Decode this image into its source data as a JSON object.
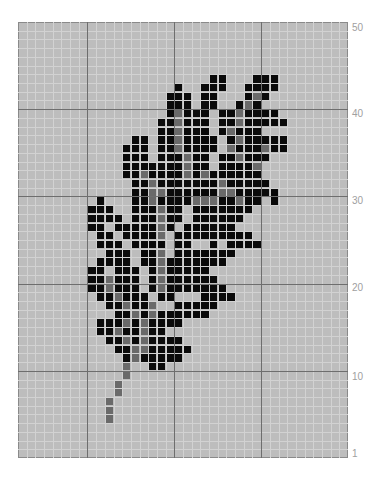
{
  "chart_data": {
    "type": "heatmap",
    "title": "",
    "grid": {
      "columns": 38,
      "rows": 50,
      "row_order": "row 50 at top, row 1 at bottom"
    },
    "major_grid_every": 10,
    "y_tick_labels": [
      "50",
      "40",
      "30",
      "20",
      "10",
      "1"
    ],
    "y_tick_rows": [
      50,
      40,
      30,
      20,
      10,
      1
    ],
    "colors": {
      "background": "#bdbdbd",
      "fill": "#0a0a0a",
      "vein": "#6a6a6a",
      "minor_grid": "#d2d2d2",
      "major_grid": "#6e6e6e",
      "label": "#a0a0a0"
    },
    "legend": {
      "#": "black cell",
      "g": "gray cell (vein/stem)"
    },
    "cells": {
      "44": {
        "#": [
          23,
          24,
          28,
          29,
          30
        ],
        "g": []
      },
      "43": {
        "#": [
          19,
          22,
          23,
          24,
          27,
          28,
          29,
          30
        ],
        "g": []
      },
      "42": {
        "#": [
          18,
          19,
          20,
          22,
          23,
          27,
          29
        ],
        "g": [
          28
        ]
      },
      "41": {
        "#": [
          18,
          19,
          20,
          22,
          23,
          26,
          28
        ],
        "g": [
          27
        ]
      },
      "40": {
        "#": [
          18,
          20,
          21,
          22,
          24,
          25,
          27,
          28,
          29,
          30
        ],
        "g": [
          19,
          26
        ]
      },
      "39": {
        "#": [
          17,
          18,
          20,
          21,
          22,
          24,
          25,
          27,
          28,
          29,
          30,
          31
        ],
        "g": [
          19,
          26
        ]
      },
      "38": {
        "#": [
          17,
          18,
          20,
          21,
          22,
          24,
          26,
          27,
          28
        ],
        "g": [
          19,
          25
        ]
      },
      "37": {
        "#": [
          14,
          15,
          17,
          18,
          20,
          21,
          22,
          23,
          25,
          27,
          28,
          29,
          30,
          31
        ],
        "g": [
          19,
          26
        ]
      },
      "36": {
        "#": [
          13,
          14,
          15,
          17,
          18,
          20,
          21,
          22,
          23,
          26,
          27,
          28,
          30,
          31
        ],
        "g": [
          19,
          25,
          29
        ]
      },
      "35": {
        "#": [
          13,
          14,
          15,
          17,
          18,
          19,
          21,
          22,
          24,
          25,
          27,
          28,
          29
        ],
        "g": [
          20,
          26
        ]
      },
      "34": {
        "#": [
          13,
          14,
          15,
          16,
          17,
          18,
          19,
          21,
          22,
          24,
          25,
          26,
          27
        ],
        "g": [
          20,
          28
        ]
      },
      "33": {
        "#": [
          13,
          14,
          16,
          17,
          18,
          19,
          21,
          23,
          24,
          25,
          26,
          27,
          28
        ],
        "g": [
          15,
          20,
          22
        ]
      },
      "32": {
        "#": [
          14,
          15,
          17,
          18,
          19,
          20,
          21,
          22,
          23,
          25,
          26,
          27,
          28,
          29
        ],
        "g": [
          16,
          24
        ]
      },
      "31": {
        "#": [
          14,
          15,
          18,
          19,
          20,
          21,
          22,
          23,
          26,
          27,
          28,
          29,
          30
        ],
        "g": [
          16,
          17,
          24,
          25
        ]
      },
      "30": {
        "#": [
          10,
          14,
          15,
          17,
          18,
          19,
          20,
          24,
          25,
          27,
          28,
          30
        ],
        "g": [
          16,
          21,
          22,
          23,
          26
        ]
      },
      "29": {
        "#": [
          9,
          10,
          11,
          14,
          15,
          16,
          18,
          19,
          21,
          22,
          23,
          24,
          25,
          26,
          27
        ],
        "g": [
          17
        ]
      },
      "28": {
        "#": [
          9,
          10,
          11,
          12,
          14,
          15,
          16,
          18,
          19,
          21,
          22,
          23,
          24,
          25,
          26
        ],
        "g": [
          17
        ]
      },
      "27": {
        "#": [
          9,
          10,
          12,
          13,
          14,
          15,
          16,
          18,
          20,
          21,
          22,
          23,
          24,
          25
        ],
        "g": [
          17
        ]
      },
      "26": {
        "#": [
          10,
          11,
          13,
          14,
          15,
          16,
          19,
          20,
          21,
          22,
          23,
          24,
          25,
          26,
          27
        ],
        "g": [
          17
        ]
      },
      "25": {
        "#": [
          10,
          11,
          12,
          14,
          15,
          16,
          17,
          19,
          20,
          23,
          25,
          26,
          27,
          28
        ],
        "g": []
      },
      "24": {
        "#": [
          11,
          12,
          13,
          15,
          16,
          19,
          20,
          21,
          22,
          23,
          24,
          25
        ],
        "g": [
          17
        ]
      },
      "23": {
        "#": [
          10,
          11,
          12,
          13,
          15,
          16,
          18,
          19,
          20,
          21,
          22,
          23,
          24
        ],
        "g": [
          17
        ]
      },
      "22": {
        "#": [
          9,
          10,
          12,
          13,
          14,
          16,
          18,
          19,
          20,
          21,
          22
        ],
        "g": [
          17
        ]
      },
      "21": {
        "#": [
          9,
          10,
          12,
          13,
          14,
          16,
          18,
          19,
          20,
          21,
          22,
          23
        ],
        "g": [
          11,
          17
        ]
      },
      "20": {
        "#": [
          9,
          10,
          12,
          13,
          14,
          16,
          18,
          19,
          20,
          21,
          22,
          23,
          24
        ],
        "g": [
          11,
          17
        ]
      },
      "19": {
        "#": [
          10,
          11,
          13,
          14,
          15,
          17,
          18,
          22,
          23,
          24,
          25
        ],
        "g": [
          12
        ]
      },
      "18": {
        "#": [
          11,
          12,
          14,
          15,
          19,
          20,
          21,
          22,
          23
        ],
        "g": [
          13,
          16
        ]
      },
      "17": {
        "#": [
          12,
          13,
          15,
          17,
          18,
          19,
          20,
          21,
          22
        ],
        "g": [
          14,
          16
        ]
      },
      "16": {
        "#": [
          10,
          11,
          12,
          14,
          16,
          17,
          18,
          19
        ],
        "g": [
          13,
          15
        ]
      },
      "15": {
        "#": [
          10,
          11,
          13,
          14,
          16,
          17
        ],
        "g": [
          12,
          15
        ]
      },
      "14": {
        "#": [
          11,
          12,
          14,
          16,
          17,
          18,
          19
        ],
        "g": [
          13,
          15
        ]
      },
      "13": {
        "#": [
          12,
          13,
          16,
          17,
          18,
          19,
          20
        ],
        "g": [
          14,
          15
        ]
      },
      "12": {
        "#": [
          13,
          15,
          16,
          17,
          18,
          19
        ],
        "g": [
          14
        ]
      },
      "11": {
        "#": [
          16,
          17
        ],
        "g": [
          13
        ]
      },
      "10": {
        "#": [],
        "g": [
          13
        ]
      },
      "9": {
        "#": [],
        "g": [
          12
        ]
      },
      "8": {
        "#": [],
        "g": [
          12
        ]
      },
      "7": {
        "#": [],
        "g": [
          11
        ]
      },
      "6": {
        "#": [],
        "g": [
          11
        ]
      },
      "5": {
        "#": [],
        "g": [
          11
        ]
      }
    }
  },
  "labels": {
    "y50": "50",
    "y40": "40",
    "y30": "30",
    "y20": "20",
    "y10": "10",
    "y1": "1"
  }
}
